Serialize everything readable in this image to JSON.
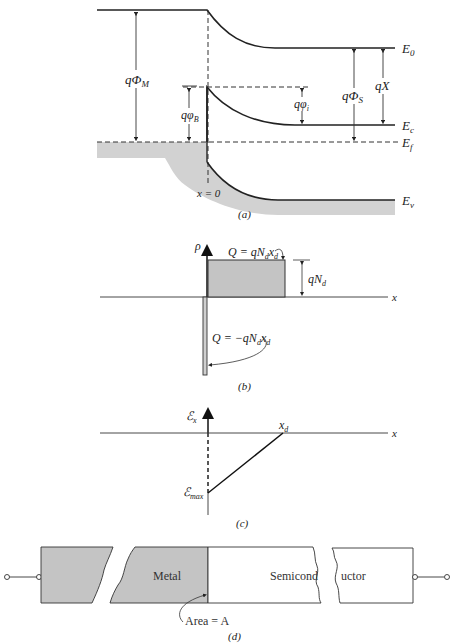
{
  "panel_a": {
    "caption": "(a)",
    "labels": {
      "E0": "E",
      "E0_sub": "0",
      "Ec": "E",
      "Ec_sub": "c",
      "Ef": "E",
      "Ef_sub": "f",
      "Ev": "E",
      "Ev_sub": "v",
      "qPhiM": "qΦ",
      "qPhiM_sub": "M",
      "qPhiB": "qφ",
      "qPhiB_sub": "B",
      "qPhii": "qφ",
      "qPhii_sub": "i",
      "qPhiS": "qΦ",
      "qPhiS_sub": "S",
      "qX": "qX",
      "x0": "x = 0"
    }
  },
  "panel_b": {
    "caption": "(b)",
    "labels": {
      "rho": "ρ",
      "x": "x",
      "Q_pos": "Q = qN",
      "Q_pos_sub1": "d",
      "Q_pos_x": "x",
      "Q_pos_sub2": "d",
      "qNd": "qN",
      "qNd_sub": "d",
      "Q_neg": "Q = −qN",
      "Q_neg_sub1": "d",
      "Q_neg_x": "x",
      "Q_neg_sub2": "d"
    }
  },
  "panel_c": {
    "caption": "(c)",
    "labels": {
      "Ex": "ℰ",
      "Ex_sub": "x",
      "x": "x",
      "xd": "x",
      "xd_sub": "d",
      "Emax": "ℰ",
      "Emax_sub": "max"
    }
  },
  "panel_d": {
    "caption": "(d)",
    "labels": {
      "metal": "Metal",
      "semicond_left": "Semicond",
      "semicond_right": "uctor",
      "area": "Area = A"
    }
  },
  "colors": {
    "line": "#222222",
    "fill_gray": "#c8c8c8",
    "band_gray": "#d4d4d4"
  }
}
